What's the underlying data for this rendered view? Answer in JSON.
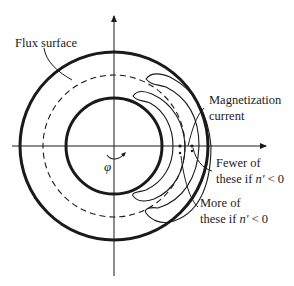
{
  "figure": {
    "labels": {
      "flux_surface": "Flux surface",
      "magnetization_line1": "Magnetization",
      "magnetization_line2": "current",
      "fewer_line1": "Fewer of",
      "fewer_line2_prefix": "these if ",
      "fewer_line2_var": "n'",
      "fewer_line2_suffix": " < 0",
      "more_line1": "More of",
      "more_line2_prefix": "these if ",
      "more_line2_var": "n'",
      "more_line2_suffix": " < 0",
      "phi": "φ"
    },
    "geometry": {
      "center": [
        114,
        146
      ],
      "outer_radius": 94,
      "flux_surface_radius": 71,
      "inner_radius": 48
    },
    "colors": {
      "stroke": "#1a1a1a",
      "background": "#ffffff"
    }
  }
}
